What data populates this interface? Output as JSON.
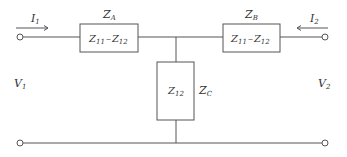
{
  "diagram": {
    "type": "T-equivalent two-port network",
    "port1": {
      "current": "I",
      "current_sub": "1",
      "voltage": "V",
      "voltage_sub": "1"
    },
    "port2": {
      "current": "I",
      "current_sub": "2",
      "voltage": "V",
      "voltage_sub": "2"
    },
    "impedances": [
      {
        "name": "Z",
        "name_sub": "A",
        "value_a": "Z",
        "value_a_sub": "11",
        "op": "–",
        "value_b": "Z",
        "value_b_sub": "12"
      },
      {
        "name": "Z",
        "name_sub": "B",
        "value_a": "Z",
        "value_a_sub": "11",
        "op": "–",
        "value_b": "Z",
        "value_b_sub": "12"
      },
      {
        "name": "Z",
        "name_sub": "C",
        "value_a": "Z",
        "value_a_sub": "12"
      }
    ],
    "colors": {
      "line": "#555555",
      "text": "#333333"
    }
  }
}
